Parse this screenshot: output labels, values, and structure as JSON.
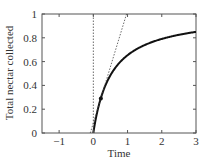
{
  "chart_data": {
    "type": "line",
    "title": "",
    "xlabel": "Time",
    "ylabel": "Total nectar collected",
    "xlim": [
      -1.5,
      3
    ],
    "ylim": [
      0,
      1
    ],
    "xticks": [
      -1,
      0,
      1,
      2,
      3
    ],
    "xtick_labels": [
      "−1",
      "0",
      "1",
      "2",
      "3"
    ],
    "yticks": [
      0,
      0.2,
      0.4,
      0.6,
      0.8,
      1
    ],
    "ytick_labels": [
      "0",
      "0.2",
      "0.4",
      "0.6",
      "0.8",
      "1"
    ],
    "grid": false,
    "legend": null,
    "series": [
      {
        "name": "gain curve",
        "style": "solid-thick",
        "x": [
          0,
          0.1,
          0.22,
          0.5,
          1,
          1.5,
          2,
          2.5,
          3
        ],
        "y": [
          0,
          0.16,
          0.29,
          0.49,
          0.65,
          0.74,
          0.79,
          0.83,
          0.85
        ]
      },
      {
        "name": "tangent line",
        "style": "dotted",
        "x": [
          -0.09,
          0.97
        ],
        "y": [
          0,
          1
        ]
      },
      {
        "name": "vertical reference at t=0",
        "style": "dotted",
        "x": [
          0,
          0
        ],
        "y": [
          0,
          1
        ]
      }
    ],
    "annotations": [
      {
        "type": "marker",
        "shape": "circle",
        "x": 0.22,
        "y": 0.29,
        "label": ""
      }
    ]
  }
}
